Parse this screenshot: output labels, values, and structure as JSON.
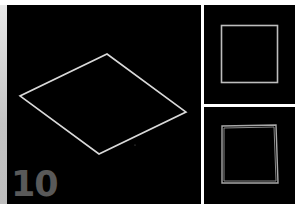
{
  "figure": {
    "step_label": "10",
    "colors": {
      "background": "#000000",
      "outline": "#d9d9d9",
      "label": "#595959",
      "divider": "#ffffff"
    },
    "panels": [
      {
        "id": "main",
        "shape": "diamond-perspective-square",
        "vertices": [
          [
            100,
            49
          ],
          [
            179,
            107
          ],
          [
            92,
            149
          ],
          [
            13,
            91
          ]
        ]
      },
      {
        "id": "top-right",
        "shape": "square",
        "rect": [
          17,
          20,
          56,
          57
        ]
      },
      {
        "id": "bottom-right",
        "shape": "slightly-rotated-double-square",
        "outer": [
          [
            18,
            19
          ],
          [
            72,
            18
          ],
          [
            74,
            76
          ],
          [
            18,
            76
          ]
        ],
        "inner": [
          [
            20,
            21
          ],
          [
            70,
            20
          ],
          [
            72,
            74
          ],
          [
            20,
            74
          ]
        ]
      }
    ]
  }
}
